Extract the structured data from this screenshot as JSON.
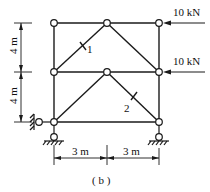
{
  "figure": {
    "caption": "( b )",
    "loads": [
      {
        "label": "10 kN",
        "node": "top-right"
      },
      {
        "label": "10 kN",
        "node": "mid-right"
      }
    ],
    "members": [
      {
        "label": "1"
      },
      {
        "label": "2"
      }
    ],
    "dimensions": {
      "vertical": [
        "4 m",
        "4 m"
      ],
      "horizontal": [
        "3 m",
        "3 m"
      ]
    },
    "colors": {
      "line": "#1a1a1a",
      "background": "#ffffff"
    }
  }
}
